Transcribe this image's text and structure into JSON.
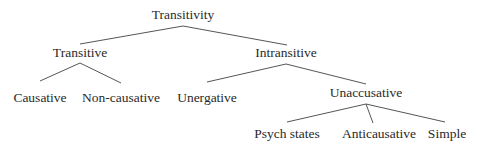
{
  "diagram": {
    "type": "tree",
    "colors": {
      "text": "#2a2a2a",
      "edge": "#555555",
      "background": "#ffffff"
    },
    "nodes": {
      "root": {
        "label": "Transitivity",
        "x": 183,
        "y": 15
      },
      "transitive": {
        "label": "Transitive",
        "x": 80,
        "y": 53
      },
      "intransitive": {
        "label": "Intransitive",
        "x": 286,
        "y": 53
      },
      "causative": {
        "label": "Causative",
        "x": 40,
        "y": 98
      },
      "noncausative": {
        "label": "Non-causative",
        "x": 121,
        "y": 98
      },
      "unergative": {
        "label": "Unergative",
        "x": 207,
        "y": 98
      },
      "unaccusative": {
        "label": "Unaccusative",
        "x": 366,
        "y": 93
      },
      "psych": {
        "label": "Psych states",
        "x": 287,
        "y": 134
      },
      "anticausative": {
        "label": "Anticausative",
        "x": 379,
        "y": 134
      },
      "simple": {
        "label": "Simple",
        "x": 447,
        "y": 134
      }
    },
    "edges": [
      {
        "from": "root",
        "to": "transitive",
        "x1": 183,
        "y1": 26,
        "x2": 80,
        "y2": 44
      },
      {
        "from": "root",
        "to": "intransitive",
        "x1": 183,
        "y1": 26,
        "x2": 287,
        "y2": 45
      },
      {
        "from": "transitive",
        "to": "causative",
        "x1": 80,
        "y1": 63,
        "x2": 40,
        "y2": 81
      },
      {
        "from": "transitive",
        "to": "noncausative",
        "x1": 80,
        "y1": 63,
        "x2": 121,
        "y2": 83
      },
      {
        "from": "intransitive",
        "to": "unergative",
        "x1": 286,
        "y1": 64,
        "x2": 207,
        "y2": 82
      },
      {
        "from": "intransitive",
        "to": "unaccusative",
        "x1": 286,
        "y1": 64,
        "x2": 366,
        "y2": 84
      },
      {
        "from": "unaccusative",
        "to": "psych",
        "x1": 366,
        "y1": 104,
        "x2": 287,
        "y2": 122
      },
      {
        "from": "unaccusative",
        "to": "anticausative",
        "x1": 366,
        "y1": 104,
        "x2": 373,
        "y2": 123
      },
      {
        "from": "unaccusative",
        "to": "simple",
        "x1": 366,
        "y1": 104,
        "x2": 445,
        "y2": 122
      }
    ]
  }
}
